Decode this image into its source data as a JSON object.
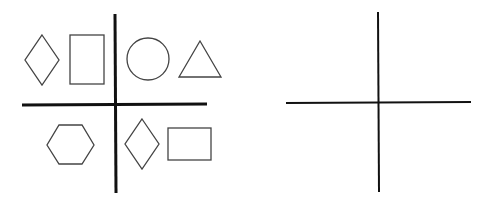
{
  "figure": {
    "width": 495,
    "height": 206,
    "background": "#ffffff",
    "stroke_color": "#444444",
    "axis_color": "#111111"
  },
  "left_panel": {
    "axes": {
      "vertical": {
        "x1": 115,
        "y1": 14,
        "x2": 116,
        "y2": 193
      },
      "horizontal": {
        "x1": 22,
        "y1": 105,
        "x2": 207,
        "y2": 104
      }
    },
    "quadrants": {
      "top_left": [
        {
          "shape": "diamond",
          "points": "42,35 59,60 42,85 25,60"
        },
        {
          "shape": "rectangle",
          "x": 70,
          "y": 35,
          "w": 34,
          "h": 49
        }
      ],
      "top_right": [
        {
          "shape": "circle",
          "cx": 148,
          "cy": 59,
          "r": 21
        },
        {
          "shape": "triangle",
          "points": "200,41 221,77 179,77"
        }
      ],
      "bottom_left": [
        {
          "shape": "hexagon",
          "points": "59,125 82,125 94,145 82,164 59,164 47,145"
        }
      ],
      "bottom_right": [
        {
          "shape": "diamond",
          "points": "142,119 159,144 142,169 125,144"
        },
        {
          "shape": "rectangle",
          "x": 168,
          "y": 128,
          "w": 43,
          "h": 32
        }
      ]
    }
  },
  "right_panel": {
    "axes": {
      "vertical": {
        "x1": 378,
        "y1": 12,
        "x2": 379,
        "y2": 192
      },
      "horizontal": {
        "x1": 286,
        "y1": 103,
        "x2": 471,
        "y2": 102
      }
    },
    "quadrants": {
      "top_left": [],
      "top_right": [],
      "bottom_left": [],
      "bottom_right": []
    }
  }
}
